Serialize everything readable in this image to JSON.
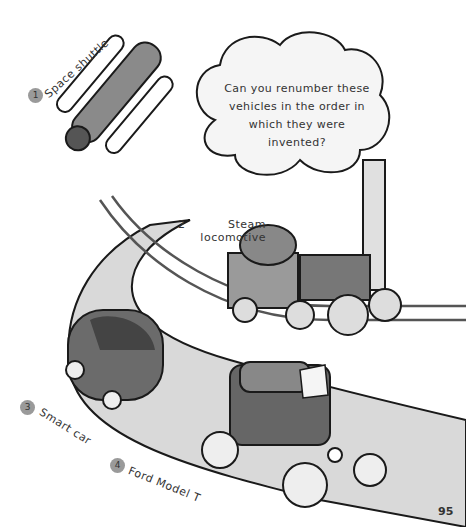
{
  "question": "Can you renumber these vehicles in the order in which they were invented?",
  "vehicles": [
    {
      "number": "1",
      "label": "Space shuttle"
    },
    {
      "number": "2",
      "label": "Steam locomotive"
    },
    {
      "number": "3",
      "label": "Smart car"
    },
    {
      "number": "4",
      "label": "Ford Model T"
    }
  ],
  "page_number": "95",
  "colors": {
    "road": "#d9d9d9",
    "outline": "#1a1a1a",
    "badge": "#9a9a9a",
    "vehicle_body": "#6b6b6b"
  }
}
